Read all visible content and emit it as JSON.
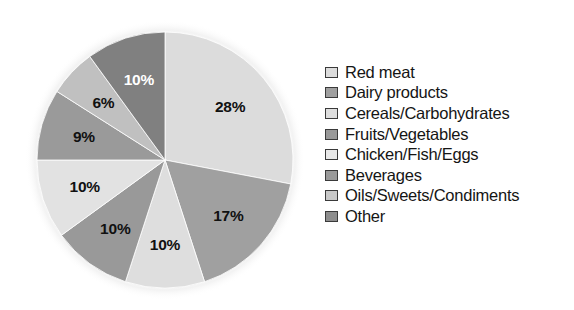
{
  "chart_data": {
    "type": "pie",
    "title": "",
    "subtitle": "",
    "xlabel": "",
    "ylabel": "",
    "legend_position": "right",
    "grid": false,
    "start_angle_deg": 0,
    "direction": "clockwise",
    "categories": [
      "Red meat",
      "Dairy products",
      "Cereals/Carbohydrates",
      "Fruits/Vegetables",
      "Chicken/Fish/Eggs",
      "Beverages",
      "Oils/Sweets/Condiments",
      "Other"
    ],
    "values": [
      28,
      17,
      10,
      10,
      10,
      9,
      6,
      10
    ],
    "value_labels": [
      "28%",
      "17%",
      "10%",
      "10%",
      "10%",
      "9%",
      "6%",
      "10%"
    ],
    "slice_colors": [
      "#dcdcdc",
      "#a0a0a0",
      "#dedede",
      "#999999",
      "#e2e2e2",
      "#9a9a9a",
      "#c0c0c0",
      "#808080"
    ],
    "label_colors": [
      "#111111",
      "#111111",
      "#111111",
      "#111111",
      "#111111",
      "#111111",
      "#111111",
      "#ffffff"
    ],
    "slices": [
      {
        "label": "Red meat",
        "value": 28,
        "display": "28%",
        "color": "#dcdcdc",
        "label_color": "#111111"
      },
      {
        "label": "Dairy products",
        "value": 17,
        "display": "17%",
        "color": "#a0a0a0",
        "label_color": "#111111"
      },
      {
        "label": "Cereals/Carbohydrates",
        "value": 10,
        "display": "10%",
        "color": "#dedede",
        "label_color": "#111111"
      },
      {
        "label": "Fruits/Vegetables",
        "value": 10,
        "display": "10%",
        "color": "#999999",
        "label_color": "#111111"
      },
      {
        "label": "Chicken/Fish/Eggs",
        "value": 10,
        "display": "10%",
        "color": "#e2e2e2",
        "label_color": "#111111"
      },
      {
        "label": "Beverages",
        "value": 9,
        "display": "9%",
        "color": "#9a9a9a",
        "label_color": "#111111"
      },
      {
        "label": "Oils/Sweets/Condiments",
        "value": 6,
        "display": "6%",
        "color": "#c0c0c0",
        "label_color": "#111111"
      },
      {
        "label": "Other",
        "value": 10,
        "display": "10%",
        "color": "#808080",
        "label_color": "#ffffff"
      }
    ]
  },
  "legend": {
    "items": [
      {
        "label": "Red meat",
        "color": "#dcdcdc"
      },
      {
        "label": "Dairy products",
        "color": "#a0a0a0"
      },
      {
        "label": "Cereals/Carbohydrates",
        "color": "#dedede"
      },
      {
        "label": "Fruits/Vegetables",
        "color": "#999999"
      },
      {
        "label": "Chicken/Fish/Eggs",
        "color": "#e8e8e8"
      },
      {
        "label": "Beverages",
        "color": "#9a9a9a"
      },
      {
        "label": "Oils/Sweets/Condiments",
        "color": "#c8c8c8"
      },
      {
        "label": "Other",
        "color": "#8d8d8d"
      }
    ]
  },
  "geometry": {
    "center_x": 165,
    "center_y": 160,
    "radius": 128,
    "label_radius_factor": 0.66
  }
}
